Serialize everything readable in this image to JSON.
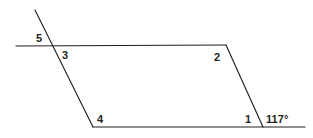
{
  "figure": {
    "type": "geometry-diagram",
    "width": 313,
    "height": 138,
    "background_color": "#ffffff",
    "stroke_color": "#231f20",
    "stroke_width": 1.15,
    "lines": [
      {
        "name": "top-parallel-line",
        "x1": 16,
        "y1": 46,
        "x2": 226,
        "y2": 45
      },
      {
        "name": "transversal-left-line",
        "x1": 35,
        "y1": 10,
        "x2": 93,
        "y2": 127
      },
      {
        "name": "bottom-parallel-line",
        "x1": 93,
        "y1": 127,
        "x2": 305,
        "y2": 127
      },
      {
        "name": "transversal-right-line",
        "x1": 226,
        "y1": 45,
        "x2": 263,
        "y2": 127
      }
    ],
    "vertices": [
      {
        "name": "upper-left-intersection",
        "x": 56,
        "y": 46
      },
      {
        "name": "upper-right-vertex",
        "x": 226,
        "y": 45
      },
      {
        "name": "lower-left-vertex",
        "x": 93,
        "y": 127
      },
      {
        "name": "lower-right-intersection",
        "x": 263,
        "y": 127
      }
    ],
    "angle_labels": [
      {
        "name": "angle-label-5",
        "text": "5",
        "x": 36,
        "y": 33
      },
      {
        "name": "angle-label-3",
        "text": "3",
        "x": 62,
        "y": 50
      },
      {
        "name": "angle-label-2",
        "text": "2",
        "x": 214,
        "y": 52
      },
      {
        "name": "angle-label-4",
        "text": "4",
        "x": 97,
        "y": 114
      },
      {
        "name": "angle-label-1",
        "text": "1",
        "x": 245,
        "y": 114
      }
    ],
    "measured_angles": [
      {
        "name": "angle-measure-117",
        "text": "117°",
        "x": 266,
        "y": 114
      }
    ]
  }
}
